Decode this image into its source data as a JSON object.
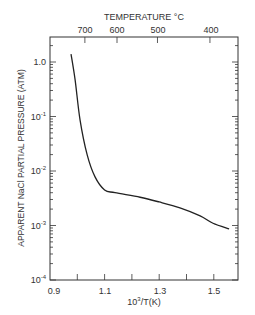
{
  "chart_data": {
    "type": "line",
    "title": "",
    "xlabel": "10^3/T(K)",
    "ylabel": "APPARENT NaCl PARTIAL PRESSURE (ATM)",
    "top_xlabel": "TEMPERATURE °C",
    "xlim": [
      0.9,
      1.587
    ],
    "ylim": [
      0.0001,
      2.9
    ],
    "yscale": "log",
    "grid": false,
    "legend": null,
    "x_tick_labels": [
      "0.9",
      "1.1",
      "1.3",
      "1.5"
    ],
    "x_ticks": [
      0.9,
      1.0,
      1.1,
      1.2,
      1.3,
      1.4,
      1.5
    ],
    "y_tick_labels": [
      "1.0",
      "10^-1",
      "10^-2",
      "10^-3",
      "10^-4"
    ],
    "y_ticks": [
      1.0,
      0.1,
      0.01,
      0.001,
      0.0001
    ],
    "top_tick_labels": [
      "700",
      "600",
      "500",
      "400"
    ],
    "top_ticks_celsius": [
      700,
      600,
      500,
      400
    ],
    "series": [
      {
        "name": "Apparent NaCl partial pressure",
        "x": [
          0.977,
          0.992,
          1.01,
          1.036,
          1.065,
          1.1,
          1.138,
          1.23,
          1.3,
          1.376,
          1.45,
          1.497,
          1.556
        ],
        "y": [
          1.4,
          0.47,
          0.087,
          0.02,
          0.0078,
          0.0045,
          0.004,
          0.0033,
          0.0027,
          0.0021,
          0.0015,
          0.0011,
          0.00087
        ]
      }
    ]
  },
  "labels": {
    "top_axis_title": "TEMPERATURE °C",
    "top_ticks": [
      "700",
      "600",
      "500",
      "400"
    ],
    "y_axis_title": "APPARENT NaCl PARTIAL PRESSURE (ATM)",
    "y_ticks": {
      "t0": {
        "base": "1.0",
        "exp": ""
      },
      "t1": {
        "base": "10",
        "exp": "-1"
      },
      "t2": {
        "base": "10",
        "exp": "-2"
      },
      "t3": {
        "base": "10",
        "exp": "-3"
      },
      "t4": {
        "base": "10",
        "exp": "-4"
      }
    },
    "x_ticks": [
      "0.9",
      "1.1",
      "1.3",
      "1.5"
    ],
    "x_axis_title_base": "10",
    "x_axis_title_exp": "3",
    "x_axis_title_rest": "/T(K)"
  }
}
